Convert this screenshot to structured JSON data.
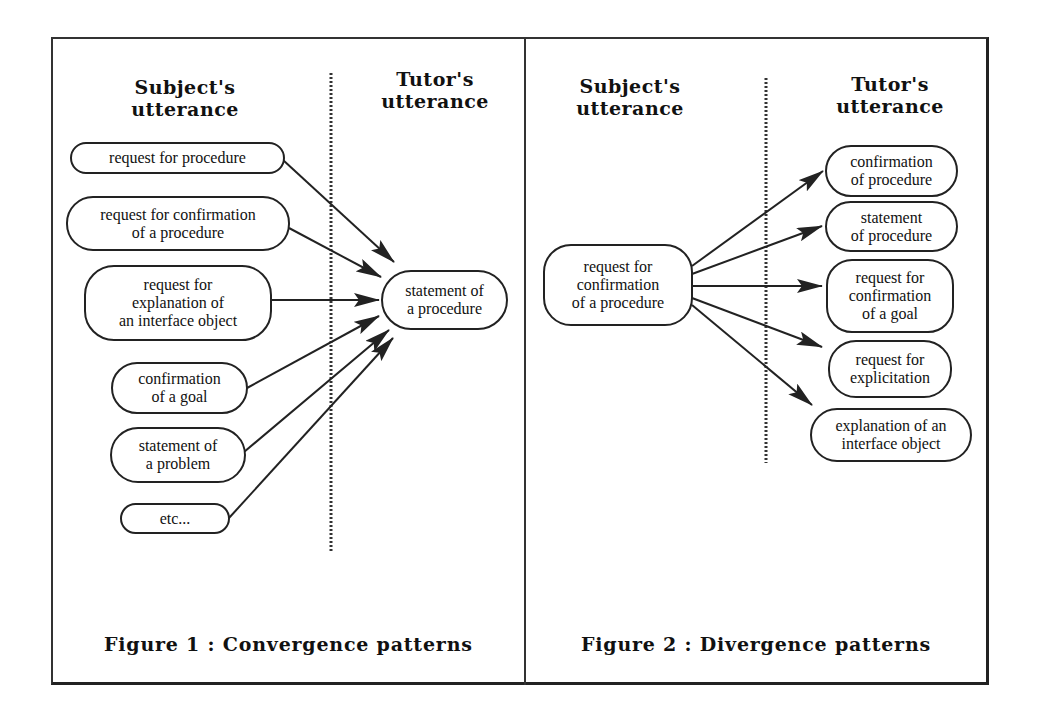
{
  "figure1": {
    "caption": "Figure 1 : Convergence patterns",
    "subject_heading": "Subject's\nutterance",
    "tutor_heading": "Tutor's\nutterance",
    "sources": [
      {
        "label": "request for procedure"
      },
      {
        "label": "request for confirmation\nof a procedure"
      },
      {
        "label": "request for\nexplanation of\nan interface object"
      },
      {
        "label": "confirmation\nof a goal"
      },
      {
        "label": "statement of\na problem"
      },
      {
        "label": "etc..."
      }
    ],
    "target": {
      "label": "statement of\na procedure"
    }
  },
  "figure2": {
    "caption": "Figure 2 : Divergence patterns",
    "subject_heading": "Subject's\nutterance",
    "tutor_heading": "Tutor's\nutterance",
    "source": {
      "label": "request for\nconfirmation\nof a procedure"
    },
    "targets": [
      {
        "label": "confirmation\nof procedure"
      },
      {
        "label": "statement\nof procedure"
      },
      {
        "label": "request for\nconfirmation\nof a goal"
      },
      {
        "label": "request for\nexplicitation"
      },
      {
        "label": "explanation of an\ninterface object"
      }
    ]
  },
  "colors": {
    "line": "#222222",
    "background": "#ffffff"
  }
}
